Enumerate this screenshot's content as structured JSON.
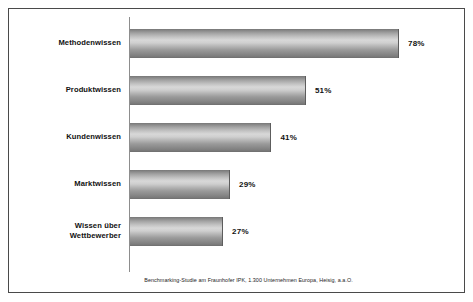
{
  "chart_data": {
    "type": "bar",
    "orientation": "horizontal",
    "title": "",
    "subtitle": "",
    "xlabel": "",
    "ylabel": "",
    "xlim": [
      0,
      78
    ],
    "grid": false,
    "legend": null,
    "categories": [
      "Methodenwissen",
      "Produktwissen",
      "Kundenwissen",
      "Marktwissen",
      "Wissen über Wettbewerber"
    ],
    "values": [
      78,
      51,
      41,
      29,
      27
    ],
    "value_labels": [
      "78%",
      "51%",
      "41%",
      "29%",
      "27%"
    ],
    "units": "%",
    "annotations": [
      "Benchmarking-Studie am Fraunhofer IPK, 1.300 Unternehmen Europa, Heisig, a.a.O."
    ]
  },
  "chart": {
    "caption": "Benchmarking-Studie am Fraunhofer IPK, 1.300 Unternehmen Europa, Heisig, a.a.O.",
    "bars": [
      {
        "label": "Methodenwissen",
        "label_line1": "Methodenwissen",
        "label_line2": "",
        "value": 78,
        "value_label": "78%"
      },
      {
        "label": "Produktwissen",
        "label_line1": "Produktwissen",
        "label_line2": "",
        "value": 51,
        "value_label": "51%"
      },
      {
        "label": "Kundenwissen",
        "label_line1": "Kundenwissen",
        "label_line2": "",
        "value": 41,
        "value_label": "41%"
      },
      {
        "label": "Marktwissen",
        "label_line1": "Marktwissen",
        "label_line2": "",
        "value": 29,
        "value_label": "29%"
      },
      {
        "label": "Wissen über Wettbewerber",
        "label_line1": "Wissen über",
        "label_line2": "Wettbewerber",
        "value": 27,
        "value_label": "27%"
      }
    ],
    "colors": {
      "frame_border": "#4a4a4a",
      "axis_line": "#8d8d8d",
      "bar_light": "#d8d8d8",
      "bar_dark": "#6e6e6e",
      "text": "#111111",
      "background": "#ffffff"
    }
  }
}
